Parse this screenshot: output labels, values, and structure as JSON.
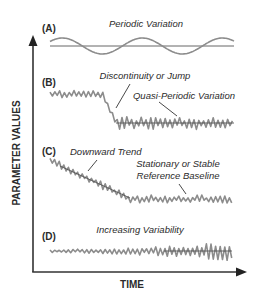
{
  "axes": {
    "y_label": "PARAMETER VALUES",
    "x_label": "TIME"
  },
  "panels": [
    {
      "id": "A",
      "letter": "(A)",
      "annotations": [
        {
          "text": "Periodic Variation",
          "x": 146,
          "y": 27,
          "anchor": "middle"
        }
      ],
      "baseline_y": 46,
      "type": "sine",
      "x_start": 50,
      "x_end": 234,
      "amplitude": 8,
      "period": 80,
      "phase_offset": 0
    },
    {
      "id": "B",
      "letter": "(B)",
      "annotations": [
        {
          "text": "Discontinuity or Jump",
          "x": 145,
          "y": 79,
          "anchor": "middle"
        },
        {
          "text": "Quasi-Periodic Variation",
          "x": 184,
          "y": 99,
          "anchor": "middle"
        }
      ],
      "leaders": [
        {
          "x1": 130,
          "y1": 84,
          "x2": 116,
          "y2": 108
        },
        {
          "x1": 159,
          "y1": 102,
          "x2": 177,
          "y2": 116
        }
      ],
      "type": "jump",
      "x_start": 50,
      "x_end": 234,
      "high_level": 94,
      "low_level": 123,
      "jump_start": 102,
      "jump_end": 116,
      "ref_line": {
        "x1": 116,
        "x2": 234,
        "y": 123
      },
      "noise_high": 5,
      "noise_low": 8,
      "seed": 11
    },
    {
      "id": "C",
      "letter": "(C)",
      "annotations": [
        {
          "text": "Downward Trend",
          "x": 70,
          "y": 155,
          "anchor": "start"
        },
        {
          "text": "Stationary or Stable",
          "x": 178,
          "y": 167,
          "anchor": "middle"
        },
        {
          "text": "Reference Baseline",
          "x": 178,
          "y": 179,
          "anchor": "middle"
        }
      ],
      "leaders": [
        {
          "x1": 97,
          "y1": 160,
          "x2": 88,
          "y2": 171
        },
        {
          "x1": 179,
          "y1": 184,
          "x2": 186,
          "y2": 194
        }
      ],
      "type": "trend",
      "x_start": 50,
      "x_end": 234,
      "start_level": 160,
      "end_level": 199,
      "trend_end_x": 130,
      "ref_line": {
        "x1": 60,
        "x2": 130,
        "y1": 166,
        "y2": 198
      },
      "noise": 5,
      "seed": 23
    },
    {
      "id": "D",
      "letter": "(D)",
      "annotations": [
        {
          "text": "Increasing Variability",
          "x": 140,
          "y": 233,
          "anchor": "middle"
        }
      ],
      "type": "variability",
      "x_start": 50,
      "x_end": 234,
      "level": 251,
      "noise_start": 2.5,
      "noise_end": 13,
      "ref_line": {
        "x1": 164,
        "x2": 232,
        "y": 251
      },
      "seed": 37
    }
  ],
  "colors": {
    "series": "#8c8c8c",
    "axis": "#333333",
    "text": "#2b2b2b"
  }
}
